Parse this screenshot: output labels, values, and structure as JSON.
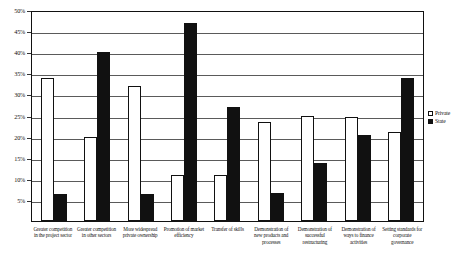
{
  "chart_data": {
    "type": "bar",
    "title": "",
    "subtitle": "",
    "xlabel": "",
    "ylabel": "",
    "ylim": [
      0,
      50
    ],
    "y_tick_values": [
      0,
      5,
      10,
      15,
      20,
      25,
      30,
      35,
      40,
      45,
      50
    ],
    "y_tick_labels": [
      "0%",
      "5%",
      "10%",
      "15%",
      "20%",
      "25%",
      "30%",
      "35%",
      "40%",
      "45%",
      "50%"
    ],
    "y_axis_unit": "%",
    "grid": true,
    "grid_axis": "y",
    "legend_position": "right",
    "categories": [
      "Greater competition in the project sector",
      "Greater competition in other sectors",
      "More widespread private ownership",
      "Promotion of market efficiency",
      "Transfer of skills",
      "Demonstration of new products and processes",
      "Demonstration of successful restructuring",
      "Demonstration of ways to finance activities",
      "Setting standards for corporate governance"
    ],
    "series": [
      {
        "name": "Private",
        "color": "#ffffff",
        "edge_color": "#111111",
        "values": [
          34,
          20,
          32,
          11,
          11,
          23.5,
          25,
          24.7,
          21
        ]
      },
      {
        "name": "State",
        "color": "#111111",
        "edge_color": "#111111",
        "values": [
          6.5,
          40,
          6.5,
          47,
          27,
          6.7,
          13.8,
          20.3,
          34
        ]
      }
    ]
  },
  "legend": {
    "entries": [
      {
        "label": "Private",
        "swatch": "open-square-swatch"
      },
      {
        "label": "State",
        "swatch": "filled-square-swatch"
      }
    ]
  }
}
